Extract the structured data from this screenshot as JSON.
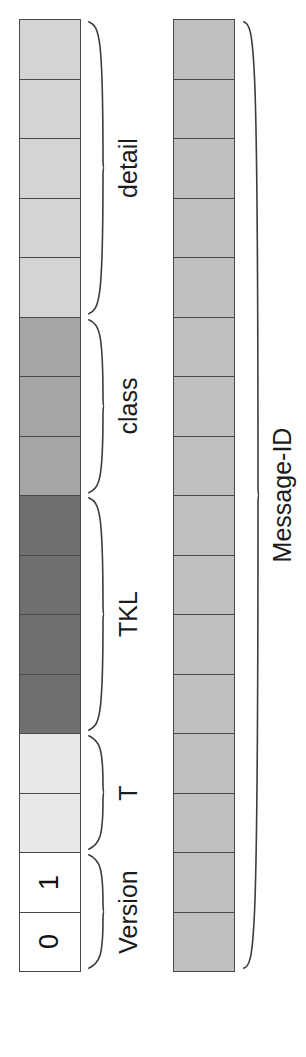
{
  "diagram": {
    "orientation": "rotated-90",
    "background_color": "#ffffff",
    "border_color": "#4a4a4a"
  },
  "columns": [
    {
      "name": "code-byte-column",
      "x": 19,
      "y": 19,
      "width": 62,
      "cell_height": 59.5,
      "cell_count": 16,
      "cells": [
        {
          "index": 0,
          "label": "",
          "fill": "#d4d4d4",
          "group": "detail"
        },
        {
          "index": 1,
          "label": "",
          "fill": "#d4d4d4",
          "group": "detail"
        },
        {
          "index": 2,
          "label": "",
          "fill": "#d4d4d4",
          "group": "detail"
        },
        {
          "index": 3,
          "label": "",
          "fill": "#d4d4d4",
          "group": "detail"
        },
        {
          "index": 4,
          "label": "",
          "fill": "#d4d4d4",
          "group": "detail"
        },
        {
          "index": 5,
          "label": "",
          "fill": "#a6a6a6",
          "group": "class"
        },
        {
          "index": 6,
          "label": "",
          "fill": "#a6a6a6",
          "group": "class"
        },
        {
          "index": 7,
          "label": "",
          "fill": "#a6a6a6",
          "group": "class"
        },
        {
          "index": 8,
          "label": "",
          "fill": "#6f6f6f",
          "group": "TKL"
        },
        {
          "index": 9,
          "label": "",
          "fill": "#6f6f6f",
          "group": "TKL"
        },
        {
          "index": 10,
          "label": "",
          "fill": "#6f6f6f",
          "group": "TKL"
        },
        {
          "index": 11,
          "label": "",
          "fill": "#6f6f6f",
          "group": "TKL"
        },
        {
          "index": 12,
          "label": "",
          "fill": "#e8e8e8",
          "group": "T"
        },
        {
          "index": 13,
          "label": "",
          "fill": "#e8e8e8",
          "group": "T"
        },
        {
          "index": 14,
          "label": "1",
          "fill": "#ffffff",
          "group": "Version"
        },
        {
          "index": 15,
          "label": "0",
          "fill": "#ffffff",
          "group": "Version"
        }
      ]
    },
    {
      "name": "message-id-column",
      "x": 173,
      "y": 19,
      "width": 62,
      "cell_height": 59.5,
      "cell_count": 16,
      "cells": [
        {
          "index": 0,
          "label": "",
          "fill": "#c0c0c0",
          "group": "Message-ID"
        },
        {
          "index": 1,
          "label": "",
          "fill": "#c0c0c0",
          "group": "Message-ID"
        },
        {
          "index": 2,
          "label": "",
          "fill": "#c0c0c0",
          "group": "Message-ID"
        },
        {
          "index": 3,
          "label": "",
          "fill": "#c0c0c0",
          "group": "Message-ID"
        },
        {
          "index": 4,
          "label": "",
          "fill": "#c0c0c0",
          "group": "Message-ID"
        },
        {
          "index": 5,
          "label": "",
          "fill": "#c0c0c0",
          "group": "Message-ID"
        },
        {
          "index": 6,
          "label": "",
          "fill": "#c0c0c0",
          "group": "Message-ID"
        },
        {
          "index": 7,
          "label": "",
          "fill": "#c0c0c0",
          "group": "Message-ID"
        },
        {
          "index": 8,
          "label": "",
          "fill": "#c0c0c0",
          "group": "Message-ID"
        },
        {
          "index": 9,
          "label": "",
          "fill": "#c0c0c0",
          "group": "Message-ID"
        },
        {
          "index": 10,
          "label": "",
          "fill": "#c0c0c0",
          "group": "Message-ID"
        },
        {
          "index": 11,
          "label": "",
          "fill": "#c0c0c0",
          "group": "Message-ID"
        },
        {
          "index": 12,
          "label": "",
          "fill": "#c0c0c0",
          "group": "Message-ID"
        },
        {
          "index": 13,
          "label": "",
          "fill": "#c0c0c0",
          "group": "Message-ID"
        },
        {
          "index": 14,
          "label": "",
          "fill": "#c0c0c0",
          "group": "Message-ID"
        },
        {
          "index": 15,
          "label": "",
          "fill": "#c0c0c0",
          "group": "Message-ID"
        }
      ]
    }
  ],
  "field_groups": [
    {
      "id": "detail",
      "label": "detail",
      "bits": 5,
      "column": "code-byte-column",
      "start_cell": 0,
      "end_cell": 4,
      "brace_x": 88,
      "label_x": 128,
      "label_font_size": 25
    },
    {
      "id": "class",
      "label": "class",
      "bits": 3,
      "column": "code-byte-column",
      "start_cell": 5,
      "end_cell": 7,
      "brace_x": 88,
      "label_x": 128,
      "label_font_size": 25
    },
    {
      "id": "tkl",
      "label": "TKL",
      "bits": 4,
      "column": "code-byte-column",
      "start_cell": 8,
      "end_cell": 11,
      "brace_x": 88,
      "label_x": 128,
      "label_font_size": 25
    },
    {
      "id": "t",
      "label": "T",
      "bits": 2,
      "column": "code-byte-column",
      "start_cell": 12,
      "end_cell": 13,
      "brace_x": 88,
      "label_x": 128,
      "label_font_size": 25
    },
    {
      "id": "version",
      "label": "Version",
      "bits": 2,
      "column": "code-byte-column",
      "start_cell": 14,
      "end_cell": 15,
      "brace_x": 88,
      "label_x": 128,
      "label_font_size": 25
    },
    {
      "id": "message-id",
      "label": "Message-ID",
      "bits": 16,
      "column": "message-id-column",
      "start_cell": 0,
      "end_cell": 15,
      "brace_x": 243,
      "label_x": 282,
      "label_font_size": 25
    }
  ],
  "bit_values": {
    "version_msb": "0",
    "version_lsb": "1"
  }
}
